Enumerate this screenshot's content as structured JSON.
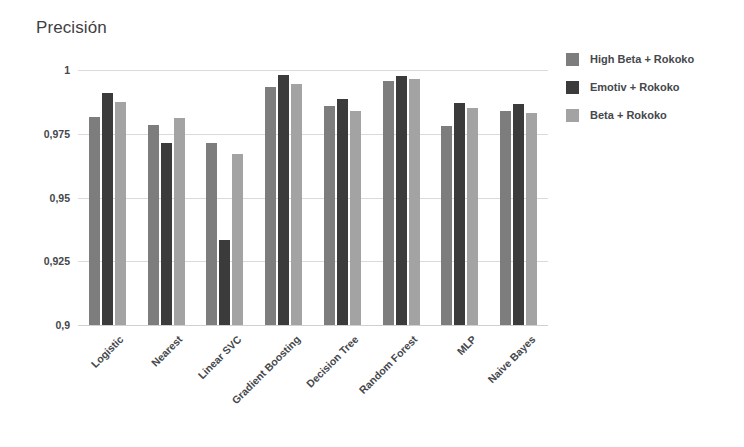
{
  "chart_data": {
    "type": "bar",
    "title": "Precisión",
    "xlabel": "",
    "ylabel": "",
    "ylim": [
      0.9,
      1.0
    ],
    "grid": true,
    "legend_position": "right",
    "ytick_labels": [
      "1",
      "0,975",
      "0,95",
      "0,925",
      "0,9"
    ],
    "ytick_values": [
      1,
      0.975,
      0.95,
      0.925,
      0.9
    ],
    "categories": [
      "Logistic",
      "Nearest",
      "Linear SVC",
      "Gradient Boosting",
      "Decision Tree",
      "Random Forest",
      "MLP",
      "Naive Bayes"
    ],
    "series": [
      {
        "name": "High Beta + Rokoko",
        "color": "#7d7d7d",
        "values": [
          0.9815,
          0.9785,
          0.9715,
          0.9935,
          0.986,
          0.9955,
          0.978,
          0.984
        ]
      },
      {
        "name": "Emotiv + Rokoko",
        "color": "#3b3b3b",
        "values": [
          0.991,
          0.9715,
          0.9335,
          0.998,
          0.9885,
          0.9975,
          0.987,
          0.9865
        ]
      },
      {
        "name": "Beta + Rokoko",
        "color": "#a3a3a3",
        "values": [
          0.9875,
          0.981,
          0.967,
          0.9945,
          0.984,
          0.9965,
          0.985,
          0.983
        ]
      }
    ]
  },
  "legend": {
    "items": [
      {
        "label": "High Beta + Rokoko"
      },
      {
        "label": "Emotiv + Rokoko"
      },
      {
        "label": "Beta + Rokoko"
      }
    ]
  },
  "colors": {
    "series_high_beta": "#7d7d7d",
    "series_emotiv": "#3b3b3b",
    "series_beta": "#a3a3a3",
    "gridline": "#d9dadc",
    "text": "#44474b",
    "background": "#ffffff"
  }
}
